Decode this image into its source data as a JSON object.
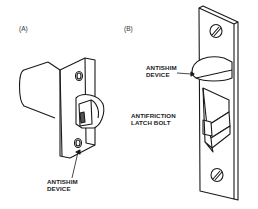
{
  "figure": {
    "panels": [
      {
        "id": "A",
        "tag": "(A)",
        "subject": "latch-bolt-assembly",
        "callouts": [
          {
            "line1": "ANTISHIM",
            "line2": "DEVICE"
          }
        ]
      },
      {
        "id": "B",
        "tag": "(B)",
        "subject": "latch-faceplate",
        "callouts": [
          {
            "line1": "ANTISHIM",
            "line2": "DEVICE"
          },
          {
            "line1": "ANTIFRICTION",
            "line2": "LATCH BOLT"
          }
        ]
      }
    ],
    "colors": {
      "line": "#1a1a1a",
      "background": "#ffffff"
    }
  }
}
